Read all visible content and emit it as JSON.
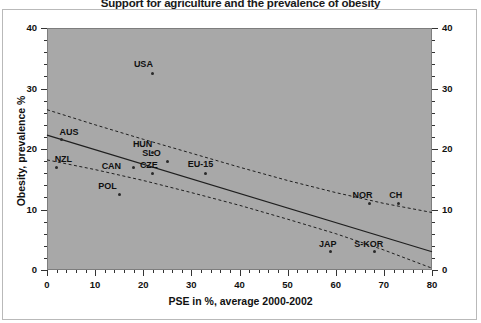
{
  "chart_data": {
    "type": "scatter",
    "title": "Support for agriculture and the prevalence of obesity",
    "xlabel": "PSE in %, average 2000-2002",
    "ylabel": "Obesity, prevalence %",
    "xlim": [
      0,
      80
    ],
    "ylim": [
      0,
      40
    ],
    "xticks": [
      0,
      10,
      20,
      30,
      40,
      50,
      60,
      70,
      80
    ],
    "yticks": [
      0,
      10,
      20,
      30,
      40
    ],
    "xtick_minor_step": 2,
    "ytick_minor_step": 2,
    "grid": false,
    "legend": "none",
    "right_axis": true,
    "right_axis_ticks": [
      0,
      10,
      20,
      30,
      40
    ],
    "plot_background": "#a8a8a8",
    "points": [
      {
        "label": "USA",
        "x": 22,
        "y": 32.5,
        "label_dx": -19,
        "label_dy": -14
      },
      {
        "label": "AUS",
        "x": 3,
        "y": 21.5,
        "label_dx": -2,
        "label_dy": -13
      },
      {
        "label": "NZL",
        "x": 2,
        "y": 17.0,
        "label_dx": -2,
        "label_dy": -13
      },
      {
        "label": "HUN",
        "x": 22,
        "y": 19.5,
        "label_dx": -20,
        "label_dy": -13
      },
      {
        "label": "SLO",
        "x": 25,
        "y": 18.0,
        "label_dx": -25,
        "label_dy": -13
      },
      {
        "label": "CAN",
        "x": 18,
        "y": 17.0,
        "label_dx": -32,
        "label_dy": -6
      },
      {
        "label": "CZE",
        "x": 22,
        "y": 16.0,
        "label_dx": -13,
        "label_dy": -13
      },
      {
        "label": "EU-15",
        "x": 33,
        "y": 16.0,
        "label_dx": -18,
        "label_dy": -14
      },
      {
        "label": "POL",
        "x": 15,
        "y": 12.5,
        "label_dx": -21,
        "label_dy": -13
      },
      {
        "label": "NOR",
        "x": 67,
        "y": 11.0,
        "label_dx": -17,
        "label_dy": -13
      },
      {
        "label": "CH",
        "x": 73,
        "y": 11.0,
        "label_dx": -9,
        "label_dy": -13
      },
      {
        "label": "JAP",
        "x": 59,
        "y": 3.0,
        "label_dx": -12,
        "label_dy": -13
      },
      {
        "label": "S-KOR",
        "x": 68,
        "y": 3.0,
        "label_dx": -20,
        "label_dy": -13
      }
    ],
    "regression_line": {
      "x0": 0,
      "y0": 22.3,
      "x1": 80,
      "y1": 3.0
    },
    "confidence_upper": [
      {
        "x": 0,
        "y": 26.5
      },
      {
        "x": 10,
        "y": 24.0
      },
      {
        "x": 20,
        "y": 21.6
      },
      {
        "x": 30,
        "y": 19.3
      },
      {
        "x": 40,
        "y": 17.0
      },
      {
        "x": 50,
        "y": 14.8
      },
      {
        "x": 60,
        "y": 12.8
      },
      {
        "x": 70,
        "y": 11.0
      },
      {
        "x": 80,
        "y": 9.5
      }
    ],
    "confidence_lower": [
      {
        "x": 0,
        "y": 18.2
      },
      {
        "x": 10,
        "y": 16.6
      },
      {
        "x": 20,
        "y": 14.8
      },
      {
        "x": 30,
        "y": 12.8
      },
      {
        "x": 40,
        "y": 10.7
      },
      {
        "x": 50,
        "y": 8.4
      },
      {
        "x": 60,
        "y": 6.0
      },
      {
        "x": 70,
        "y": 3.3
      },
      {
        "x": 80,
        "y": 0.3
      }
    ]
  }
}
